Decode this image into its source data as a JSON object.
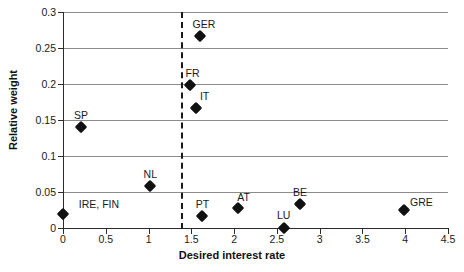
{
  "chart_data": {
    "type": "scatter",
    "title": "",
    "xlabel": "Desired interest rate",
    "ylabel": "Relative weight",
    "xlim": [
      0,
      4.5
    ],
    "ylim": [
      0,
      0.3
    ],
    "grid": true,
    "legend": "none",
    "xticks": [
      "0",
      "0.5",
      "1",
      "1.5",
      "2",
      "2.5",
      "3",
      "3.5",
      "4",
      "4.5"
    ],
    "xtick_values": [
      0,
      0.5,
      1,
      1.5,
      2,
      2.5,
      3,
      3.5,
      4,
      4.5
    ],
    "yticks": [
      "0",
      "0.05",
      "0.1",
      "0.15",
      "0.2",
      "0.25",
      "0.3"
    ],
    "ytick_values": [
      0,
      0.05,
      0.1,
      0.15,
      0.2,
      0.25,
      0.3
    ],
    "annotations": [
      {
        "label": "Threshold",
        "type": "vertical-dashed-line",
        "x": 1.38
      }
    ],
    "points": [
      {
        "label": "IRE, FIN",
        "x": 0.0,
        "y": 0.02,
        "label_dx": 36,
        "label_dy": -15
      },
      {
        "label": "SP",
        "x": 0.21,
        "y": 0.14,
        "label_dx": 0,
        "label_dy": -17
      },
      {
        "label": "NL",
        "x": 1.02,
        "y": 0.059,
        "label_dx": 0,
        "label_dy": -17
      },
      {
        "label": "GER",
        "x": 1.6,
        "y": 0.267,
        "label_dx": 4,
        "label_dy": -17
      },
      {
        "label": "FR",
        "x": 1.49,
        "y": 0.199,
        "label_dx": 2,
        "label_dy": -17
      },
      {
        "label": "IT",
        "x": 1.55,
        "y": 0.167,
        "label_dx": 9,
        "label_dy": -17
      },
      {
        "label": "PT",
        "x": 1.63,
        "y": 0.017,
        "label_dx": 0,
        "label_dy": -17
      },
      {
        "label": "AT",
        "x": 2.04,
        "y": 0.028,
        "label_dx": 6,
        "label_dy": -16
      },
      {
        "label": "LU",
        "x": 2.58,
        "y": 0.0,
        "label_dx": 0,
        "label_dy": -18
      },
      {
        "label": "BE",
        "x": 2.77,
        "y": 0.033,
        "label_dx": 0,
        "label_dy": -17
      },
      {
        "label": "GRE",
        "x": 3.99,
        "y": 0.025,
        "label_dx": 17,
        "label_dy": -13
      }
    ]
  },
  "colors": {
    "marker": "#111111",
    "gridline": "#8c8c8c",
    "axis": "#2b2b2b",
    "threshold": "#1a1a1a",
    "background": "#ffffff"
  }
}
